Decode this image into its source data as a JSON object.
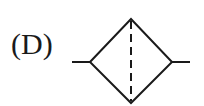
{
  "diagram": {
    "label": "(D)",
    "symbol": "filter-symbol",
    "stroke_color": "#1a1a1a",
    "background": "#ffffff",
    "shape": {
      "type": "diamond-with-dashed-vertical-axis",
      "left_vertex": [
        90,
        62
      ],
      "top_vertex": [
        131,
        19
      ],
      "right_vertex": [
        172,
        62
      ],
      "bottom_vertex": [
        131,
        103
      ],
      "left_lead": [
        [
          72,
          62
        ],
        [
          90,
          62
        ]
      ],
      "right_lead": [
        [
          172,
          62
        ],
        [
          190,
          62
        ]
      ],
      "dashed_line": [
        [
          131,
          19
        ],
        [
          131,
          103
        ]
      ]
    }
  }
}
